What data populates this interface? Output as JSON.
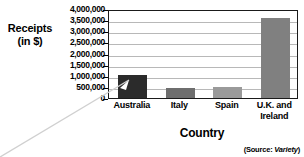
{
  "chart_data": {
    "type": "bar",
    "title": "",
    "categories": [
      "Australia",
      "Italy",
      "Spain",
      "U.K. and Ireland"
    ],
    "category_lines": [
      [
        "Australia"
      ],
      [
        "Italy"
      ],
      [
        "Spain"
      ],
      [
        "U.K. and",
        "Ireland"
      ]
    ],
    "values": [
      1050000,
      450000,
      500000,
      3600000
    ],
    "bar_colors": [
      "#2b2b2b",
      "#6e6e6e",
      "#9a9a9a",
      "#808080"
    ],
    "xlabel": "Country",
    "ylabel": "Receipts (in $)",
    "ylabel_lines": [
      "Receipts",
      "(in $)"
    ],
    "ylim": [
      0,
      4000000
    ],
    "ytick_step": 500000,
    "ytick_labels": [
      "4,000,000",
      "3,500,000",
      "3,000,000",
      "2,500,000",
      "2,000,000",
      "1,500,000",
      "1,000,000",
      "500,000",
      "0"
    ],
    "ytick_values": [
      4000000,
      3500000,
      3000000,
      2500000,
      2000000,
      1500000,
      1000000,
      500000,
      0
    ],
    "grid": true,
    "grid_color": "#b8b8b8",
    "legend": false,
    "legend_position": "none",
    "plot_border_color": "#1a1a1a",
    "background": "#ffffff"
  },
  "annotations": {
    "source_prefix": "(Source: ",
    "source_name": "Variety",
    "source_suffix": ")",
    "leader_line_color": "#d0d0d0"
  }
}
